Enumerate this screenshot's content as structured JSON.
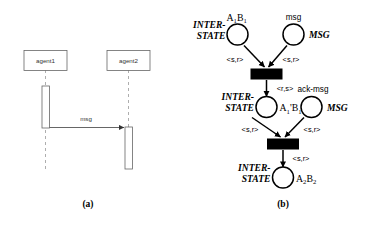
{
  "figure": {
    "panels": [
      {
        "id": "panel-a",
        "caption": "(a)",
        "type": "uml-sequence-diagram",
        "actors": [
          {
            "id": "agent1",
            "label": "agent1"
          },
          {
            "id": "agent2",
            "label": "agent2"
          }
        ],
        "messages": [
          {
            "id": "msg1",
            "label": "msg",
            "from": "agent1",
            "to": "agent2"
          }
        ]
      },
      {
        "id": "panel-b",
        "caption": "(b)",
        "type": "petri-net",
        "places": [
          {
            "id": "place-interstate-1",
            "name": "INTER-",
            "name_line2": "STATE",
            "token": "A",
            "token_sub1": "1",
            "token_b": "B",
            "token_sub2": "1",
            "token_full": "A1B1"
          },
          {
            "id": "place-msg",
            "name": "msg",
            "type_label": "MSG"
          },
          {
            "id": "place-interstate-2",
            "name": "INTER-",
            "name_line2": "STATE",
            "token": "A",
            "token_sub1": "1",
            "token_prime1": "'",
            "token_b": "B",
            "token_sub2": "1",
            "token_prime2": "'",
            "token_full": "A1'B1'"
          },
          {
            "id": "place-ack-msg",
            "name": "ack-msg",
            "type_label": "MSG"
          },
          {
            "id": "place-interstate-3",
            "name": "INTER-",
            "name_line2": "STATE",
            "token": "A",
            "token_sub1": "2",
            "token_b": "B",
            "token_sub2": "2",
            "token_full": "A2B2"
          }
        ],
        "transitions": [
          {
            "id": "transition-1"
          },
          {
            "id": "transition-2"
          }
        ],
        "arcs": [
          {
            "id": "arc-interstate1-to-t1",
            "label": "<s,r>"
          },
          {
            "id": "arc-msg-to-t1",
            "label": "<s,r>"
          },
          {
            "id": "arc-t1-to-interstate2",
            "label": "<r,s>"
          },
          {
            "id": "arc-interstate2-to-t2",
            "label": "<s,r>"
          },
          {
            "id": "arc-ackmsg-to-t2",
            "label": "<s,r>"
          },
          {
            "id": "arc-t2-to-interstate3",
            "label": "<s,r>"
          }
        ]
      }
    ]
  },
  "colors": {
    "background": "#ffffff",
    "ink": "#000000",
    "seq_stroke": "#666666",
    "seq_lifeline": "#999999",
    "seq_text": "#333333"
  }
}
